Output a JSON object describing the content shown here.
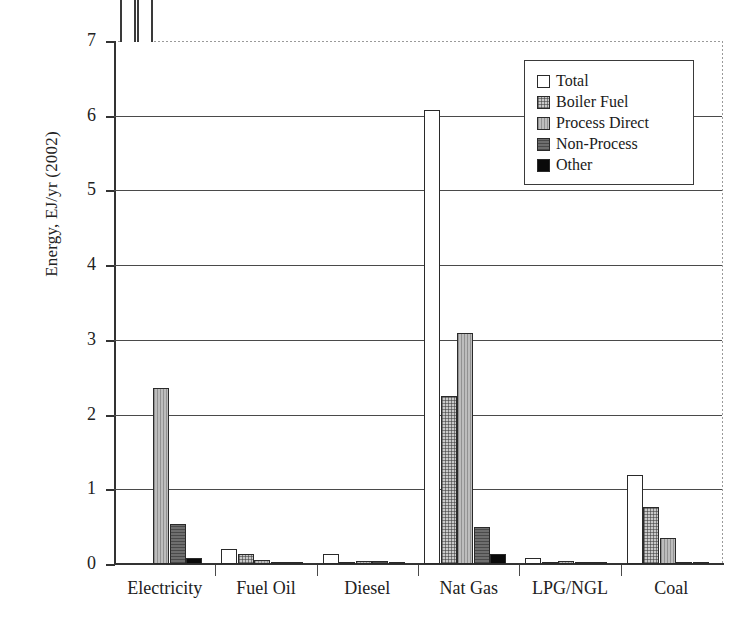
{
  "chart_data": {
    "type": "bar",
    "title": "",
    "xlabel": "",
    "ylabel": "Energy, EJ/yr (2002)",
    "ylim": [
      0,
      7
    ],
    "yticks": [
      "0",
      "1",
      "2",
      "3",
      "4",
      "5",
      "6",
      "7"
    ],
    "grid": true,
    "legend_position": "upper right",
    "categories": [
      "Electricity",
      "Fuel Oil",
      "Diesel",
      "Nat Gas",
      "LPG/NGL",
      "Coal"
    ],
    "series": [
      {
        "name": "Total",
        "swatch": "#ffffff",
        "fill": "f-total",
        "values": [
          10.5,
          0.2,
          0.13,
          6.08,
          0.08,
          1.19
        ],
        "clipped": [
          true,
          false,
          false,
          false,
          false,
          false
        ]
      },
      {
        "name": "Boiler Fuel",
        "swatch": "#c9c9c9",
        "fill": "f-boiler",
        "values": [
          8.2,
          0.13,
          0.012,
          2.25,
          0.012,
          0.76
        ],
        "clipped": [
          true,
          false,
          false,
          false,
          false,
          false
        ]
      },
      {
        "name": "Process Direct",
        "swatch": "#bdbdbd",
        "fill": "f-process",
        "values": [
          2.35,
          0.05,
          0.04,
          3.09,
          0.04,
          0.35
        ],
        "clipped": [
          false,
          false,
          false,
          false,
          false,
          false
        ]
      },
      {
        "name": "Non-Process",
        "swatch": "#6e6e6e",
        "fill": "f-nonprocess",
        "values": [
          0.53,
          0.015,
          0.035,
          0.5,
          0.008,
          0.02
        ],
        "clipped": [
          false,
          false,
          false,
          false,
          false,
          false
        ]
      },
      {
        "name": "Other",
        "swatch": "#0a0a0a",
        "fill": "f-other",
        "values": [
          0.08,
          0.006,
          0.006,
          0.14,
          0.005,
          0.006
        ],
        "clipped": [
          false,
          false,
          false,
          false,
          false,
          false
        ]
      }
    ]
  },
  "legend": {
    "items": [
      {
        "label": "Total"
      },
      {
        "label": "Boiler Fuel"
      },
      {
        "label": "Process Direct"
      },
      {
        "label": "Non-Process"
      },
      {
        "label": "Other"
      }
    ]
  },
  "axis": {
    "y_title": "Energy, EJ/yr (2002)"
  }
}
